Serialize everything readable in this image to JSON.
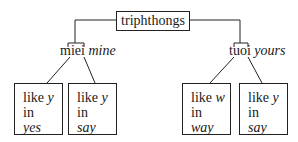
{
  "root": {
    "label": "triphthongs"
  },
  "branches": [
    {
      "word": "miei",
      "gloss": "mine",
      "leaves": [
        {
          "line1": "like",
          "sound": "y",
          "line2": "in",
          "example": "yes"
        },
        {
          "line1": "like",
          "sound": "y",
          "line2": "in",
          "example": "say"
        }
      ]
    },
    {
      "word": "tuoi",
      "gloss": "yours",
      "leaves": [
        {
          "line1": "like",
          "sound": "w",
          "line2": "in",
          "example": "way"
        },
        {
          "line1": "like",
          "sound": "y",
          "line2": "in",
          "example": "say"
        }
      ]
    }
  ]
}
